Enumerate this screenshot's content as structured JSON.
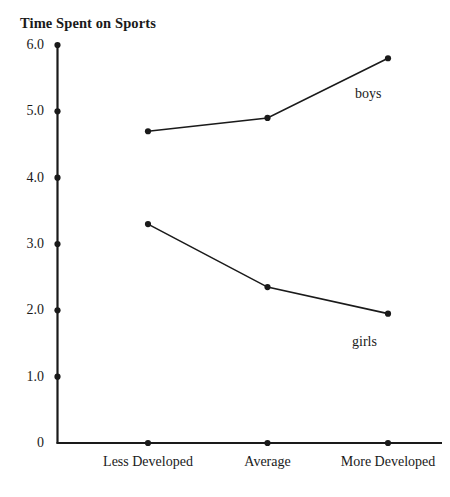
{
  "page": {
    "clipped_top_line": ""
  },
  "chart_data": {
    "type": "line",
    "title": "Time Spent on Sports",
    "xlabel": "",
    "ylabel": "",
    "categories": [
      "Less Developed",
      "Average",
      "More Developed"
    ],
    "series": [
      {
        "name": "boys",
        "values": [
          4.7,
          4.9,
          5.8
        ],
        "label_text": "boys"
      },
      {
        "name": "girls",
        "values": [
          3.3,
          2.35,
          1.95
        ],
        "label_text": "girls"
      }
    ],
    "ylim": [
      0,
      6.0
    ],
    "yticks": [
      0,
      1.0,
      2.0,
      3.0,
      4.0,
      5.0,
      6.0
    ],
    "ytick_labels": [
      "0",
      "1.0",
      "2.0",
      "3.0",
      "4.0",
      "5.0",
      "6.0"
    ],
    "grid": false,
    "legend": "inline-annotations",
    "marker": "filled-circle",
    "line_color": "#1a1a1a",
    "axis_color": "#1a1a1a"
  }
}
